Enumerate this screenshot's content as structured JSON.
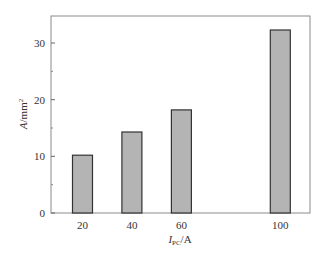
{
  "chart_data": {
    "type": "bar",
    "title": "",
    "categories": [
      "20",
      "40",
      "60",
      "100"
    ],
    "x": [
      20,
      40,
      60,
      100
    ],
    "values": [
      10.2,
      14.3,
      18.2,
      32.3
    ],
    "xlabel": "I_PC/A",
    "xlabel_main": "I",
    "xlabel_sub": "PC",
    "xlabel_unit": "/A",
    "ylabel": "A/mm²",
    "ylabel_main": "A",
    "ylabel_unit": "/mm",
    "ylabel_sup": "2",
    "ylim": [
      0,
      35
    ],
    "yticks": [
      0,
      10,
      20,
      30
    ],
    "yminor_ticks": [
      5,
      15,
      25
    ],
    "xticks": [
      20,
      40,
      60,
      100
    ],
    "grid": false,
    "legend": null,
    "bar_color": "#b4b4b4",
    "bar_edge_color": "#333333"
  }
}
